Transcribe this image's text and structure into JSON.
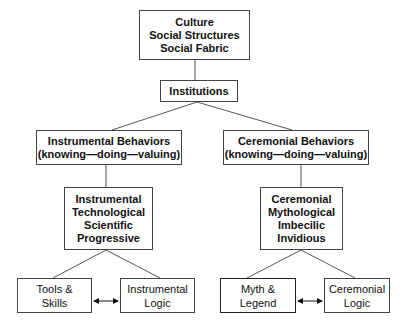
{
  "diagram": {
    "root": {
      "lines": [
        "Culture",
        "Social Structures",
        "Social Fabric"
      ]
    },
    "institutions": {
      "label": "Institutions"
    },
    "instrumental_behaviors": {
      "lines": [
        "Instrumental Behaviors",
        "(knowing—doing—valuing)"
      ]
    },
    "ceremonial_behaviors": {
      "lines": [
        "Ceremonial Behaviors",
        "(knowing—doing—valuing)"
      ]
    },
    "instrumental_traits": {
      "lines": [
        "Instrumental",
        "Technological",
        "Scientific",
        "Progressive"
      ]
    },
    "ceremonial_traits": {
      "lines": [
        "Ceremonial",
        "Mythological",
        "Imbecilic",
        "Invidious"
      ]
    },
    "tools_skills": {
      "lines": [
        "Tools &",
        "Skills"
      ]
    },
    "instrumental_logic": {
      "lines": [
        "Instrumental",
        "Logic"
      ]
    },
    "myth_legend": {
      "lines": [
        "Myth &",
        "Legend"
      ]
    },
    "ceremonial_logic": {
      "lines": [
        "Ceremonial",
        "Logic"
      ]
    },
    "connectors": {
      "bidirectional_arrow_left": "double-headed-arrow",
      "bidirectional_arrow_right": "double-headed-arrow"
    },
    "colors": {
      "border": "#444444",
      "line": "#555555",
      "text": "#111111",
      "background": "#ffffff"
    }
  }
}
